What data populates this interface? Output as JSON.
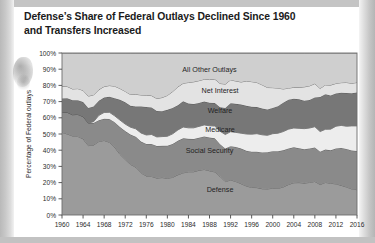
{
  "title": "Defense’s Share of Federal Outlays Declined Since 1960 and Transfers Increased",
  "chart_data": {
    "type": "area",
    "stacked": true,
    "title": "Defense’s Share of Federal Outlays Declined Since 1960 and Transfers Increased",
    "xlabel": "",
    "ylabel": "Percentage of Federal outlays",
    "ylim": [
      0,
      100
    ],
    "xlim": [
      1960,
      2016
    ],
    "grid": false,
    "legend_position": "inline-labels",
    "y_ticks": [
      "0%",
      "10%",
      "20%",
      "30%",
      "40%",
      "50%",
      "60%",
      "70%",
      "80%",
      "90%",
      "100%"
    ],
    "y_tick_values": [
      0,
      10,
      20,
      30,
      40,
      50,
      60,
      70,
      80,
      90,
      100
    ],
    "x_ticks": [
      "1960",
      "1964",
      "1968",
      "1972",
      "1976",
      "1980",
      "1984",
      "1988",
      "1992",
      "1996",
      "2000",
      "2004",
      "2008",
      "2012",
      "2016"
    ],
    "x_tick_values": [
      1960,
      1964,
      1968,
      1972,
      1976,
      1980,
      1984,
      1988,
      1992,
      1996,
      2000,
      2004,
      2008,
      2012,
      2016
    ],
    "x": [
      1960,
      1961,
      1962,
      1963,
      1964,
      1965,
      1966,
      1967,
      1968,
      1969,
      1970,
      1971,
      1972,
      1973,
      1974,
      1975,
      1976,
      1977,
      1978,
      1979,
      1980,
      1981,
      1982,
      1983,
      1984,
      1985,
      1986,
      1987,
      1988,
      1989,
      1990,
      1991,
      1992,
      1993,
      1994,
      1995,
      1996,
      1997,
      1998,
      1999,
      2000,
      2001,
      2002,
      2003,
      2004,
      2005,
      2006,
      2007,
      2008,
      2009,
      2010,
      2011,
      2012,
      2013,
      2014,
      2015,
      2016
    ],
    "series": [
      {
        "name": "Defense",
        "color": "#9b9b9b",
        "values": [
          51.0,
          50.0,
          48.8,
          48.5,
          47.0,
          42.8,
          43.2,
          45.4,
          46.0,
          44.9,
          41.8,
          37.5,
          34.3,
          31.2,
          29.5,
          26.0,
          24.1,
          23.8,
          22.8,
          23.1,
          22.7,
          23.2,
          24.8,
          26.0,
          26.7,
          26.7,
          27.6,
          28.1,
          27.3,
          26.6,
          23.9,
          20.6,
          21.6,
          20.7,
          19.3,
          17.9,
          17.0,
          16.9,
          16.2,
          16.1,
          16.5,
          16.4,
          17.3,
          18.8,
          19.9,
          20.0,
          19.7,
          20.1,
          20.7,
          18.8,
          20.1,
          19.6,
          19.2,
          18.3,
          17.3,
          16.1,
          15.6
        ]
      },
      {
        "name": "Social Security",
        "color": "#8a8a8a",
        "values": [
          12.6,
          13.4,
          13.1,
          13.6,
          13.7,
          14.0,
          13.6,
          13.1,
          13.4,
          14.4,
          15.5,
          16.8,
          17.5,
          18.5,
          18.8,
          19.3,
          19.8,
          20.1,
          19.8,
          19.6,
          20.1,
          20.6,
          21.0,
          21.3,
          20.3,
          20.2,
          20.1,
          20.4,
          20.5,
          20.7,
          19.8,
          20.5,
          20.9,
          21.3,
          21.7,
          21.8,
          22.1,
          22.2,
          22.4,
          22.7,
          22.9,
          23.0,
          22.6,
          22.3,
          21.9,
          21.2,
          20.9,
          21.0,
          21.0,
          20.3,
          20.3,
          20.3,
          21.9,
          23.0,
          23.5,
          23.7,
          23.9
        ]
      },
      {
        "name": "Medicare",
        "color": "#ededed",
        "values": [
          0.0,
          0.0,
          0.0,
          0.0,
          0.0,
          0.0,
          0.8,
          3.0,
          3.9,
          4.1,
          3.9,
          4.3,
          4.3,
          4.5,
          4.9,
          5.3,
          5.5,
          5.8,
          5.6,
          5.7,
          5.8,
          6.3,
          6.7,
          7.0,
          6.8,
          6.9,
          7.0,
          7.1,
          7.3,
          7.6,
          8.0,
          8.6,
          8.9,
          9.0,
          9.5,
          10.3,
          10.8,
          11.1,
          10.9,
          10.4,
          10.8,
          11.1,
          11.6,
          11.9,
          11.9,
          12.3,
          12.7,
          12.6,
          12.8,
          12.4,
          12.5,
          13.1,
          13.7,
          14.0,
          14.0,
          15.2,
          15.5
        ]
      },
      {
        "name": "Welfare",
        "color": "#777777",
        "values": [
          8.3,
          8.7,
          8.9,
          8.8,
          9.0,
          9.3,
          9.4,
          9.0,
          9.2,
          9.6,
          10.9,
          12.5,
          13.5,
          13.2,
          13.7,
          16.4,
          17.3,
          16.7,
          16.0,
          15.7,
          16.3,
          16.0,
          15.2,
          15.9,
          15.0,
          14.7,
          14.5,
          14.4,
          14.2,
          14.2,
          14.8,
          16.4,
          17.6,
          17.6,
          17.7,
          17.4,
          16.9,
          16.4,
          16.2,
          16.0,
          15.9,
          16.7,
          17.8,
          18.2,
          18.1,
          17.9,
          17.3,
          17.3,
          18.1,
          21.3,
          21.7,
          20.8,
          20.2,
          20.2,
          20.5,
          20.2,
          20.6
        ]
      },
      {
        "name": "Net Interest",
        "color": "#e3e3e3",
        "values": [
          7.5,
          7.2,
          7.0,
          7.1,
          7.2,
          7.3,
          7.1,
          6.9,
          6.8,
          6.9,
          7.4,
          7.0,
          6.7,
          7.0,
          7.6,
          7.1,
          7.2,
          7.3,
          7.7,
          8.4,
          8.9,
          10.1,
          11.4,
          11.1,
          13.0,
          13.7,
          13.7,
          13.8,
          14.3,
          14.8,
          14.7,
          14.7,
          14.4,
          14.1,
          13.9,
          15.3,
          15.5,
          15.2,
          14.6,
          13.5,
          12.5,
          11.1,
          8.5,
          7.1,
          7.0,
          7.4,
          8.5,
          8.7,
          8.5,
          5.3,
          5.7,
          6.4,
          6.2,
          6.2,
          6.5,
          6.1,
          6.2
        ]
      },
      {
        "name": "All Other Outlays",
        "color": "#cfcfcf",
        "values": [
          20.6,
          20.7,
          22.2,
          22.0,
          23.1,
          26.6,
          25.9,
          22.6,
          20.7,
          20.1,
          20.5,
          21.9,
          23.7,
          25.6,
          25.5,
          25.9,
          26.1,
          26.3,
          28.1,
          27.5,
          26.2,
          23.8,
          20.9,
          18.7,
          18.2,
          17.8,
          17.1,
          16.2,
          16.4,
          16.1,
          18.8,
          19.2,
          16.6,
          17.3,
          17.9,
          17.3,
          17.7,
          18.2,
          19.7,
          21.3,
          21.4,
          21.7,
          22.2,
          21.7,
          21.2,
          21.2,
          20.9,
          20.3,
          18.9,
          21.9,
          19.7,
          19.8,
          18.8,
          18.3,
          18.2,
          18.7,
          18.2
        ]
      }
    ],
    "inline_labels": [
      {
        "text": "All Other Outlays",
        "x": 1988,
        "y": 88
      },
      {
        "text": "Net Interest",
        "x": 1990,
        "y": 75.5
      },
      {
        "text": "Welfare",
        "x": 1990,
        "y": 63
      },
      {
        "text": "Medicare",
        "x": 1990,
        "y": 51
      },
      {
        "text": "Social Security",
        "x": 1988,
        "y": 38
      },
      {
        "text": "Defense",
        "x": 1990,
        "y": 14
      }
    ]
  }
}
